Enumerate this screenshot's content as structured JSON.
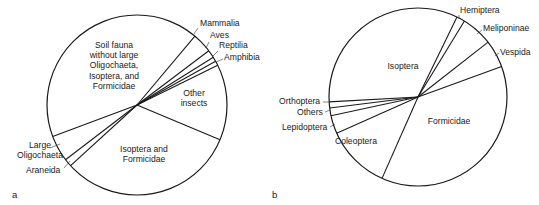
{
  "chart_data": [
    {
      "type": "pie",
      "panel_label": "a",
      "title": "",
      "center": [
        137,
        105
      ],
      "radius": 90,
      "start_angle_deg": 50,
      "direction": "clockwise",
      "slices": [
        {
          "label": "Mammalia",
          "value": 3.6,
          "label_pos": [
            200,
            26
          ],
          "anchor": "start",
          "leader": [
            [
              198,
              28
            ],
            [
              194,
              34
            ]
          ]
        },
        {
          "label": "Aves",
          "value": 1.4,
          "label_pos": [
            210,
            38
          ],
          "anchor": "start",
          "leader": [
            [
              209,
              42
            ],
            [
              206,
              48
            ]
          ]
        },
        {
          "label": "Reptilia",
          "value": 0.8,
          "label_pos": [
            219,
            48
          ],
          "anchor": "start",
          "leader": [
            [
              218,
              51
            ],
            [
              213,
              56
            ]
          ]
        },
        {
          "label": "Amphibia",
          "value": 0.8,
          "label_pos": [
            224,
            60
          ],
          "anchor": "start",
          "leader": [
            [
              223,
              59
            ],
            [
              216,
              62
            ]
          ]
        },
        {
          "label": "Other insects",
          "value": 13.6,
          "label_lines": [
            "Other",
            "insects"
          ],
          "label_pos": [
            194,
            96
          ],
          "anchor": "middle"
        },
        {
          "label": "Isoptera and Formicidae",
          "value": 31.9,
          "label_lines": [
            "Isoptera and",
            "Formicidae"
          ],
          "label_pos": [
            144,
            152
          ],
          "anchor": "middle"
        },
        {
          "label": "Araneida",
          "value": 1.4,
          "label_pos": [
            26,
            173
          ],
          "anchor": "start",
          "leader": [
            [
              64,
              168
            ],
            [
              70,
              161
            ]
          ]
        },
        {
          "label": "Large Oligochaeta",
          "value": 4.7,
          "label_lines": [
            "Large",
            "Oligochaeta"
          ],
          "label_pos": [
            40,
            148
          ],
          "anchor": "middle",
          "leader": [
            [
              50,
              148
            ],
            [
              60,
              144
            ]
          ]
        },
        {
          "label": "Soil fauna without large Oligochaeta, Isoptera, and Formicidae",
          "value": 41.8,
          "label_lines": [
            "Soil fauna",
            "without large",
            "Oligochaeta,",
            "Isoptera, and",
            "Formicidae"
          ],
          "label_pos": [
            114,
            48
          ],
          "anchor": "middle"
        }
      ]
    },
    {
      "type": "pie",
      "panel_label": "b",
      "title": "",
      "center": [
        418,
        97
      ],
      "radius": 89,
      "start_angle_deg": 64,
      "direction": "clockwise",
      "slices": [
        {
          "label": "Hemiptera",
          "value": 1.5,
          "label_pos": [
            460,
            13
          ],
          "anchor": "start",
          "leader": [
            [
              459,
              15
            ],
            [
              459,
              19
            ]
          ]
        },
        {
          "label": "Meliponinae",
          "value": 5.7,
          "label_pos": [
            483,
            31
          ],
          "anchor": "start",
          "leader": [
            [
              482,
              30
            ],
            [
              477,
              34
            ]
          ]
        },
        {
          "label": "Vespida",
          "value": 5.0,
          "label_pos": [
            500,
            55
          ],
          "anchor": "start",
          "leader": [
            [
              499,
              53
            ],
            [
              495,
              56
            ]
          ]
        },
        {
          "label": "Formicidae",
          "value": 37.2,
          "label_pos": [
            449,
            124
          ],
          "anchor": "middle"
        },
        {
          "label": "Coleoptera",
          "value": 11.7,
          "label_pos": [
            356,
            144
          ],
          "anchor": "middle"
        },
        {
          "label": "Lepidoptera",
          "value": 3.3,
          "label_pos": [
            282,
            130
          ],
          "anchor": "start",
          "leader": [
            [
              330,
              127
            ],
            [
              335,
              124
            ]
          ]
        },
        {
          "label": "Others",
          "value": 1.4,
          "label_pos": [
            297,
            115
          ],
          "anchor": "start",
          "leader": [
            [
              325,
              112
            ],
            [
              330,
              110
            ]
          ]
        },
        {
          "label": "Orthoptera",
          "value": 1.1,
          "label_pos": [
            279,
            104
          ],
          "anchor": "start",
          "leader": [
            [
              323,
              102
            ],
            [
              329,
              102
            ]
          ]
        },
        {
          "label": "Isoptera",
          "value": 33.1,
          "label_pos": [
            403,
            69
          ],
          "anchor": "middle"
        }
      ]
    }
  ],
  "figure": {
    "panel_a_label": "a",
    "panel_b_label": "b",
    "panel_a_label_pos": [
      12,
      198
    ],
    "panel_b_label_pos": [
      272,
      198
    ]
  }
}
